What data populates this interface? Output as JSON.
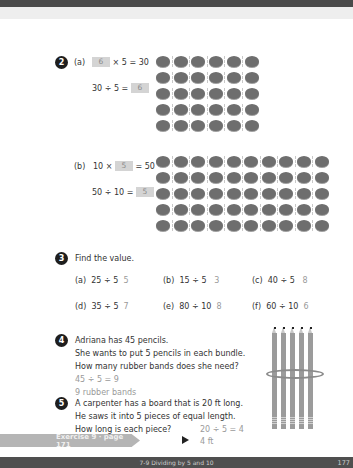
{
  "page": {
    "footer_title": "7-9 Dividing by 5 and 10",
    "page_number": "177"
  },
  "q2": {
    "number": "2",
    "a": {
      "label": "(a)",
      "eq1_box": "6",
      "eq1_rest": "× 5 = 30",
      "eq2_lead": "30 ÷ 5 =",
      "eq2_box": "6",
      "grid_cols": 6,
      "grid_rows": 5
    },
    "b": {
      "label": "(b)",
      "eq1_lead": "10 ×",
      "eq1_box": "5",
      "eq1_rest": "= 50",
      "eq2_lead": "50 ÷ 10 =",
      "eq2_box": "5",
      "grid_cols": 10,
      "grid_rows": 5
    }
  },
  "q3": {
    "number": "3",
    "prompt": "Find the value.",
    "items": [
      {
        "label": "(a)",
        "expr": "25 ÷ 5",
        "answer": "5"
      },
      {
        "label": "(b)",
        "expr": "15 ÷ 5",
        "answer": "3"
      },
      {
        "label": "(c)",
        "expr": "40 ÷ 5",
        "answer": "8"
      },
      {
        "label": "(d)",
        "expr": "35 ÷ 5",
        "answer": "7"
      },
      {
        "label": "(e)",
        "expr": "80 ÷ 10",
        "answer": "8"
      },
      {
        "label": "(f)",
        "expr": "60 ÷ 10",
        "answer": "6"
      }
    ]
  },
  "q4": {
    "number": "4",
    "lines": [
      "Adriana has 45 pencils.",
      "She wants to put 5 pencils in each bundle.",
      "How many rubber bands does she need?"
    ],
    "work": "45 ÷ 5 = 9",
    "answer": "9 rubber bands"
  },
  "q5": {
    "number": "5",
    "lines": [
      "A carpenter has a board that is 20 ft long.",
      "He saws it into 5 pieces of equal length.",
      "How long is each piece?"
    ],
    "work": "20 ÷ 5 = 4",
    "answer": "4 ft"
  },
  "exercise": {
    "label": "Exercise 9 · page 171"
  }
}
